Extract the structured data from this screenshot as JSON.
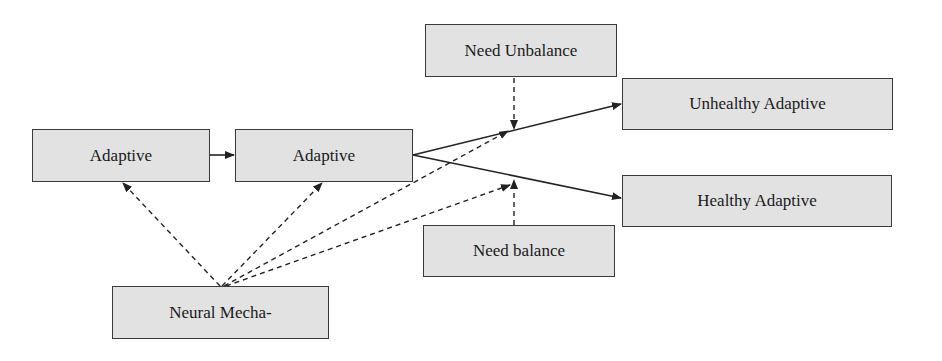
{
  "diagram": {
    "nodes": [
      {
        "id": "adaptive_1",
        "label": "Adaptive"
      },
      {
        "id": "adaptive_2",
        "label": "Adaptive"
      },
      {
        "id": "need_unbalance",
        "label": "Need Unbalance"
      },
      {
        "id": "unhealthy_adaptive",
        "label": "Unhealthy Adaptive"
      },
      {
        "id": "healthy_adaptive",
        "label": "Healthy Adaptive"
      },
      {
        "id": "need_balance",
        "label": "Need balance"
      },
      {
        "id": "neural_mechanism",
        "label": "Neural Mecha-"
      }
    ],
    "edges": [
      {
        "from": "adaptive_1",
        "to": "adaptive_2",
        "style": "solid"
      },
      {
        "from": "adaptive_2",
        "to": "unhealthy_adaptive",
        "style": "solid"
      },
      {
        "from": "adaptive_2",
        "to": "healthy_adaptive",
        "style": "solid"
      },
      {
        "from": "need_unbalance",
        "to": "edge:adaptive_2->unhealthy_adaptive",
        "style": "dashed"
      },
      {
        "from": "need_balance",
        "to": "edge:adaptive_2->healthy_adaptive",
        "style": "dashed"
      },
      {
        "from": "neural_mechanism",
        "to": "adaptive_1",
        "style": "dashed"
      },
      {
        "from": "neural_mechanism",
        "to": "adaptive_2",
        "style": "dashed"
      },
      {
        "from": "neural_mechanism",
        "to": "edge:adaptive_2->unhealthy_adaptive",
        "style": "dashed"
      },
      {
        "from": "neural_mechanism",
        "to": "edge:adaptive_2->healthy_adaptive",
        "style": "dashed"
      }
    ],
    "colors": {
      "node_fill": "#e2e2e2",
      "node_border": "#3a3a3a",
      "edge": "#222222",
      "text": "#1a1a1a",
      "background": "#ffffff"
    }
  }
}
